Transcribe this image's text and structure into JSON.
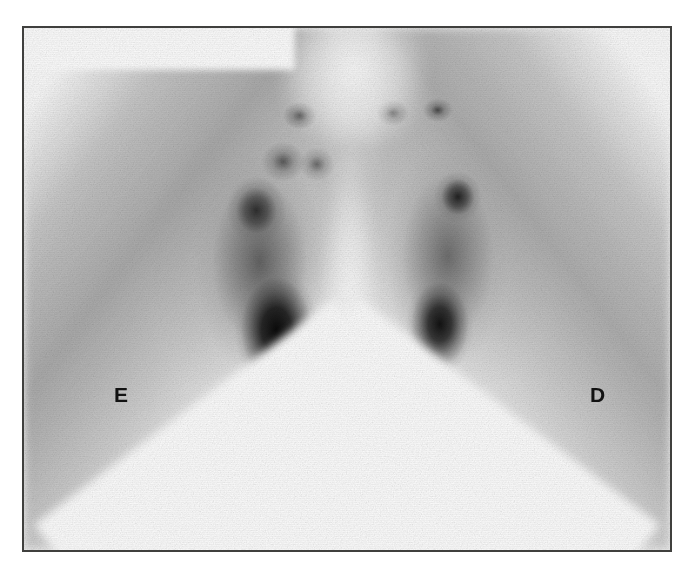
{
  "figure": {
    "modality": "planar scintigraphy",
    "view": "anterior",
    "colormap": "grayscale-inverted",
    "frame_border_color": "#40403e",
    "page_background": "#ffffff",
    "panel_background": "#fdfdfd"
  },
  "markers": {
    "left": {
      "label": "E",
      "meaning": "esquerda (patient left side of image)",
      "color": "#121212"
    },
    "right": {
      "label": "D",
      "meaning": "direita (patient right side of image)",
      "color": "#121212"
    }
  },
  "caption": {
    "sliver_text": ""
  },
  "chart_data": {
    "type": "heatmap",
    "title": "",
    "xlabel": "",
    "ylabel": "",
    "legend_position": "none",
    "grid": false,
    "xlim": [
      0,
      100
    ],
    "ylim": [
      0,
      100
    ],
    "intensity_scale": {
      "min_label": "low counts",
      "max_label": "high counts",
      "min_color": "#ffffff",
      "max_color": "#0a0a0a"
    },
    "regions": [
      {
        "name": "left-inferior-focus",
        "x": 39.5,
        "y": 57.5,
        "intensity": 0.96,
        "label": ""
      },
      {
        "name": "right-inferior-focus",
        "x": 63.8,
        "y": 56.5,
        "intensity": 0.94,
        "label": ""
      },
      {
        "name": "left-superior-focus",
        "x": 36.5,
        "y": 35.5,
        "intensity": 0.82,
        "label": ""
      },
      {
        "name": "right-superior-focus",
        "x": 66.5,
        "y": 33.0,
        "intensity": 0.88,
        "label": ""
      },
      {
        "name": "midline-dot-left",
        "x": 43.0,
        "y": 18.0,
        "intensity": 0.8,
        "label": ""
      },
      {
        "name": "midline-dot-right-a",
        "x": 56.8,
        "y": 17.5,
        "intensity": 0.82,
        "label": ""
      },
      {
        "name": "midline-dot-right-b",
        "x": 63.5,
        "y": 17.0,
        "intensity": 0.78,
        "label": ""
      },
      {
        "name": "left-gland-body",
        "x": 37.0,
        "y": 45.0,
        "intensity": 0.72,
        "label": ""
      },
      {
        "name": "right-gland-body",
        "x": 65.0,
        "y": 44.0,
        "intensity": 0.68,
        "label": ""
      },
      {
        "name": "left-inferior-tail",
        "x": 46.2,
        "y": 90.0,
        "intensity": 0.62,
        "label": ""
      },
      {
        "name": "right-inferior-tail",
        "x": 57.8,
        "y": 92.0,
        "intensity": 0.6,
        "label": ""
      },
      {
        "name": "midline-photopenic",
        "x": 50.5,
        "y": 50.0,
        "intensity": 0.08,
        "label": ""
      },
      {
        "name": "superior-notch-clear",
        "x": 51.0,
        "y": 6.0,
        "intensity": 0.03,
        "label": ""
      }
    ]
  }
}
